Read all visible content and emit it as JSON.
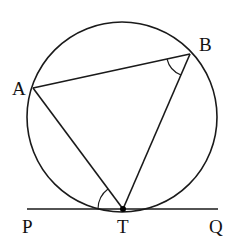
{
  "diagram": {
    "type": "circle-tangent-chord",
    "points": {
      "A": {
        "label": "A"
      },
      "B": {
        "label": "B"
      },
      "T": {
        "label": "T"
      },
      "P": {
        "label": "P"
      },
      "Q": {
        "label": "Q"
      }
    },
    "segments": [
      "AB",
      "AT",
      "BT",
      "PQ"
    ],
    "tangent_line": "PQ",
    "tangent_point": "T",
    "marked_angles": [
      "ATP",
      "ABT"
    ],
    "colors": {
      "ink": "#1a1a1a",
      "background": "#ffffff"
    }
  }
}
